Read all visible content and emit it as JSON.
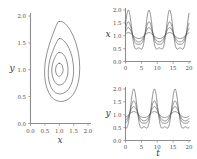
{
  "figure": {
    "background": "#ffffff",
    "curve_color": "#4c4c4c",
    "axis_color": "#8e8e8e"
  },
  "chart_data": [
    {
      "type": "line",
      "name": "phase-portrait",
      "title": "",
      "xlabel": "x",
      "ylabel": "y",
      "xlim": [
        0.0,
        2.0
      ],
      "ylim": [
        0.0,
        2.0
      ],
      "xticks": [
        0.0,
        0.5,
        1.0,
        1.5,
        2.0
      ],
      "xtick_labels": [
        "0.0",
        "0.5",
        "1.0",
        "1.5",
        "2.0"
      ],
      "yticks": [
        0.0,
        0.5,
        1.0,
        1.5,
        2.0
      ],
      "ytick_labels": [
        "0.0",
        "0.5",
        "1.0",
        "1.5",
        "2.0"
      ],
      "grid": false,
      "legend": "none",
      "center": [
        1.0,
        1.0
      ],
      "series": [
        {
          "name": "orbit-1-innermost",
          "closed": true,
          "points": [
            [
              1.0,
              1.12
            ],
            [
              1.08,
              1.1
            ],
            [
              1.13,
              1.03
            ],
            [
              1.12,
              0.95
            ],
            [
              1.05,
              0.89
            ],
            [
              0.97,
              0.88
            ],
            [
              0.9,
              0.92
            ],
            [
              0.87,
              1.0
            ],
            [
              0.9,
              1.07
            ],
            [
              0.95,
              1.11
            ]
          ]
        },
        {
          "name": "orbit-2",
          "closed": true,
          "points": [
            [
              1.0,
              1.32
            ],
            [
              1.12,
              1.3
            ],
            [
              1.24,
              1.2
            ],
            [
              1.3,
              1.05
            ],
            [
              1.29,
              0.9
            ],
            [
              1.2,
              0.78
            ],
            [
              1.06,
              0.72
            ],
            [
              0.92,
              0.73
            ],
            [
              0.8,
              0.82
            ],
            [
              0.74,
              0.96
            ],
            [
              0.77,
              1.11
            ],
            [
              0.86,
              1.24
            ],
            [
              0.93,
              1.3
            ]
          ]
        },
        {
          "name": "orbit-3",
          "closed": true,
          "points": [
            [
              1.0,
              1.58
            ],
            [
              1.16,
              1.54
            ],
            [
              1.34,
              1.4
            ],
            [
              1.46,
              1.2
            ],
            [
              1.5,
              0.98
            ],
            [
              1.45,
              0.78
            ],
            [
              1.31,
              0.63
            ],
            [
              1.12,
              0.56
            ],
            [
              0.92,
              0.56
            ],
            [
              0.75,
              0.64
            ],
            [
              0.64,
              0.8
            ],
            [
              0.62,
              1.0
            ],
            [
              0.68,
              1.2
            ],
            [
              0.8,
              1.38
            ],
            [
              0.9,
              1.5
            ]
          ]
        },
        {
          "name": "orbit-4-outermost",
          "closed": true,
          "points": [
            [
              1.0,
              1.9
            ],
            [
              1.2,
              1.86
            ],
            [
              1.42,
              1.7
            ],
            [
              1.6,
              1.46
            ],
            [
              1.7,
              1.18
            ],
            [
              1.7,
              0.9
            ],
            [
              1.6,
              0.66
            ],
            [
              1.42,
              0.5
            ],
            [
              1.18,
              0.42
            ],
            [
              0.94,
              0.42
            ],
            [
              0.72,
              0.5
            ],
            [
              0.56,
              0.68
            ],
            [
              0.49,
              0.92
            ],
            [
              0.53,
              1.2
            ],
            [
              0.66,
              1.48
            ],
            [
              0.82,
              1.72
            ],
            [
              0.92,
              1.85
            ]
          ]
        }
      ]
    },
    {
      "type": "line",
      "name": "prey-time-series",
      "title": "",
      "xlabel": "t",
      "ylabel": "x",
      "xlim": [
        0,
        20
      ],
      "ylim": [
        0.0,
        2.0
      ],
      "xticks": [
        0,
        5,
        10,
        15,
        20
      ],
      "xtick_labels": [
        "0",
        "5",
        "10",
        "15",
        "20"
      ],
      "yticks": [
        0.0,
        0.5,
        1.0,
        1.5,
        2.0
      ],
      "ytick_labels": [
        "0.0",
        "0.5",
        "1.0",
        "1.5",
        "2.0"
      ],
      "grid": false,
      "legend": "none",
      "equilibrium": 1.0,
      "period": 6.5,
      "peak_phase": 0.9,
      "series": [
        {
          "name": "amplitude-1",
          "amplitude": 0.12,
          "skew": 0.08
        },
        {
          "name": "amplitude-2",
          "amplitude": 0.3,
          "skew": 0.18
        },
        {
          "name": "amplitude-3",
          "amplitude": 0.5,
          "skew": 0.3
        },
        {
          "name": "amplitude-4",
          "amplitude": 0.9,
          "skew": 0.45
        }
      ]
    },
    {
      "type": "line",
      "name": "predator-time-series",
      "title": "",
      "xlabel": "t",
      "ylabel": "y",
      "xlim": [
        0,
        20
      ],
      "ylim": [
        0.0,
        2.0
      ],
      "xticks": [
        0,
        5,
        10,
        15,
        20
      ],
      "xtick_labels": [
        "0",
        "5",
        "10",
        "15",
        "20"
      ],
      "yticks": [
        0.0,
        0.5,
        1.0,
        1.5,
        2.0
      ],
      "ytick_labels": [
        "0.0",
        "0.5",
        "1.0",
        "1.5",
        "2.0"
      ],
      "grid": false,
      "legend": "none",
      "equilibrium": 1.0,
      "period": 6.5,
      "peak_phase": 2.6,
      "series": [
        {
          "name": "amplitude-1",
          "amplitude": 0.12,
          "skew": 0.08
        },
        {
          "name": "amplitude-2",
          "amplitude": 0.3,
          "skew": 0.18
        },
        {
          "name": "amplitude-3",
          "amplitude": 0.5,
          "skew": 0.3
        },
        {
          "name": "amplitude-4",
          "amplitude": 0.9,
          "skew": 0.45
        }
      ]
    }
  ]
}
